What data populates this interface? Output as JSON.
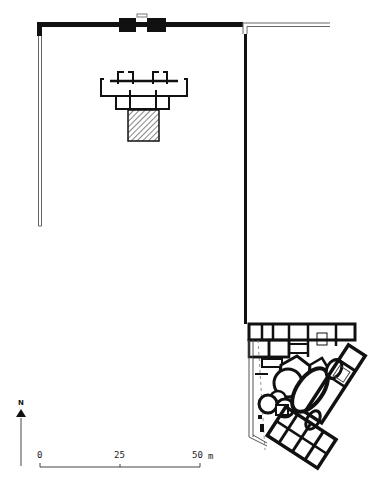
{
  "plan": {
    "type": "architectural-site-plan",
    "colors": {
      "wall": "#111111",
      "light_wall": "#888888",
      "background": "#ffffff",
      "hatch": "#333333"
    }
  },
  "north_arrow": {
    "label": "N"
  },
  "scale_bar": {
    "ticks": [
      "0",
      "25",
      "50"
    ],
    "unit": "m"
  }
}
